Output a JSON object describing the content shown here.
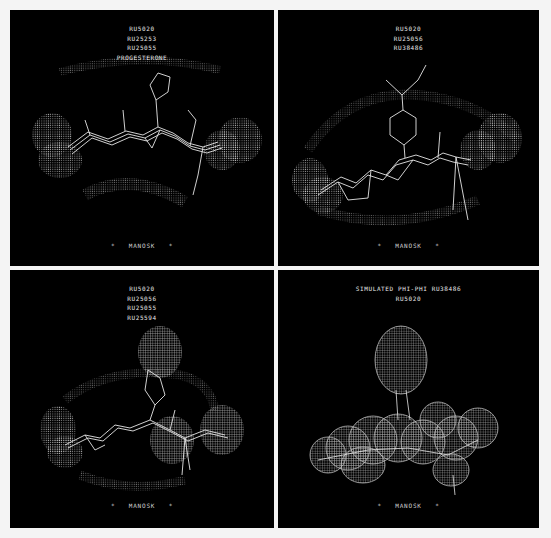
{
  "figure": {
    "background": "#f4f4f4",
    "panel_background": "#000000",
    "foreground": "#e8e8e8",
    "panels": [
      {
        "position": "top-left",
        "labels": [
          "RU5020",
          "RU25253",
          "RU25055",
          "PROGESTERONE"
        ],
        "footer": "MANOSK",
        "footer_marker": "*"
      },
      {
        "position": "top-right",
        "labels": [
          "RU5020",
          "RU25056",
          "RU38486"
        ],
        "footer": "MANOSK",
        "footer_marker": "*"
      },
      {
        "position": "bottom-left",
        "labels": [
          "RU5020",
          "RU25056",
          "RU25055",
          "RU25594"
        ],
        "footer": "MANOSK",
        "footer_marker": "*"
      },
      {
        "position": "bottom-right",
        "labels": [
          "SIMULATED PHI-PHI RU38486",
          "RU5020"
        ],
        "footer": "MANOSK",
        "footer_marker": "*"
      }
    ]
  }
}
